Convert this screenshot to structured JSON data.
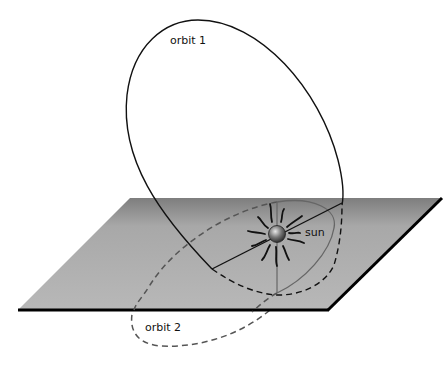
{
  "diagram": {
    "labels": {
      "orbit1": "orbit 1",
      "orbit2": "orbit 2",
      "sun": "sun"
    },
    "colors": {
      "plane_top": "#8a8a8a",
      "plane_bottom": "#b8b8b8",
      "plane_edge": "#000000",
      "orbit1_line": "#111111",
      "orbit2_line": "#555555",
      "sun_fill": "#555555"
    }
  }
}
